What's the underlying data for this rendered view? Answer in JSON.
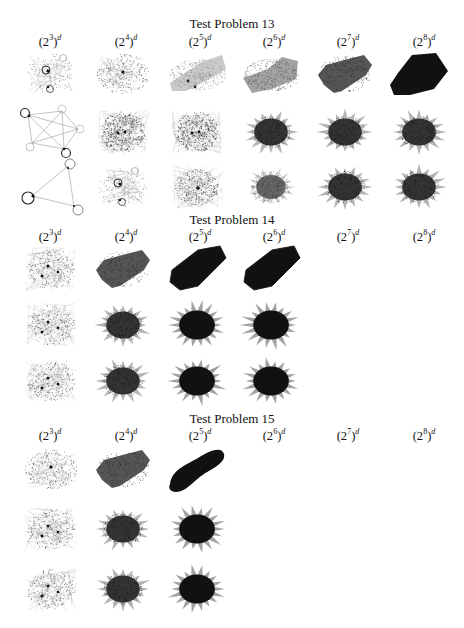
{
  "figure": {
    "column_labels": [
      {
        "base": "(2",
        "exp": "3",
        "close": ")",
        "power": "d"
      },
      {
        "base": "(2",
        "exp": "4",
        "close": ")",
        "power": "d"
      },
      {
        "base": "(2",
        "exp": "5",
        "close": ")",
        "power": "d"
      },
      {
        "base": "(2",
        "exp": "6",
        "close": ")",
        "power": "d"
      },
      {
        "base": "(2",
        "exp": "7",
        "close": ")",
        "power": "d"
      },
      {
        "base": "(2",
        "exp": "8",
        "close": ")",
        "power": "d"
      }
    ],
    "sections": [
      {
        "title": "Test Problem 13",
        "rows": 3,
        "filled_columns": 6,
        "row_styles": [
          [
            "sparse-graph-with-loops",
            "sparse-dots",
            "grey-blob",
            "grey-blob-dense",
            "dark-blob",
            "black-blob"
          ],
          [
            "complete-graph-5-nodes",
            "dense-star",
            "dense-star",
            "spiky-dark",
            "spiky-dark",
            "spiky-dark"
          ],
          [
            "triangle-graph",
            "sparse-graph-with-loops",
            "medium-star",
            "medium-spiky",
            "spiky-dark",
            "spiky-dark"
          ]
        ]
      },
      {
        "title": "Test Problem 14",
        "rows": 3,
        "filled_columns": 4,
        "row_styles": [
          [
            "sparse-star",
            "dark-blob",
            "black-rect",
            "black-rect"
          ],
          [
            "sparse-star",
            "spiky-dark",
            "spiky-black",
            "spiky-black"
          ],
          [
            "sparse-star",
            "spiky-dark",
            "spiky-black",
            "spiky-black"
          ]
        ]
      },
      {
        "title": "Test Problem 15",
        "rows": 3,
        "filled_columns": 3,
        "row_styles": [
          [
            "sparse-dots",
            "dark-blob",
            "black-bean"
          ],
          [
            "sparse-star",
            "spiky-dark",
            "spiky-black"
          ],
          [
            "sparse-star",
            "spiky-dark",
            "spiky-black"
          ]
        ]
      }
    ]
  }
}
